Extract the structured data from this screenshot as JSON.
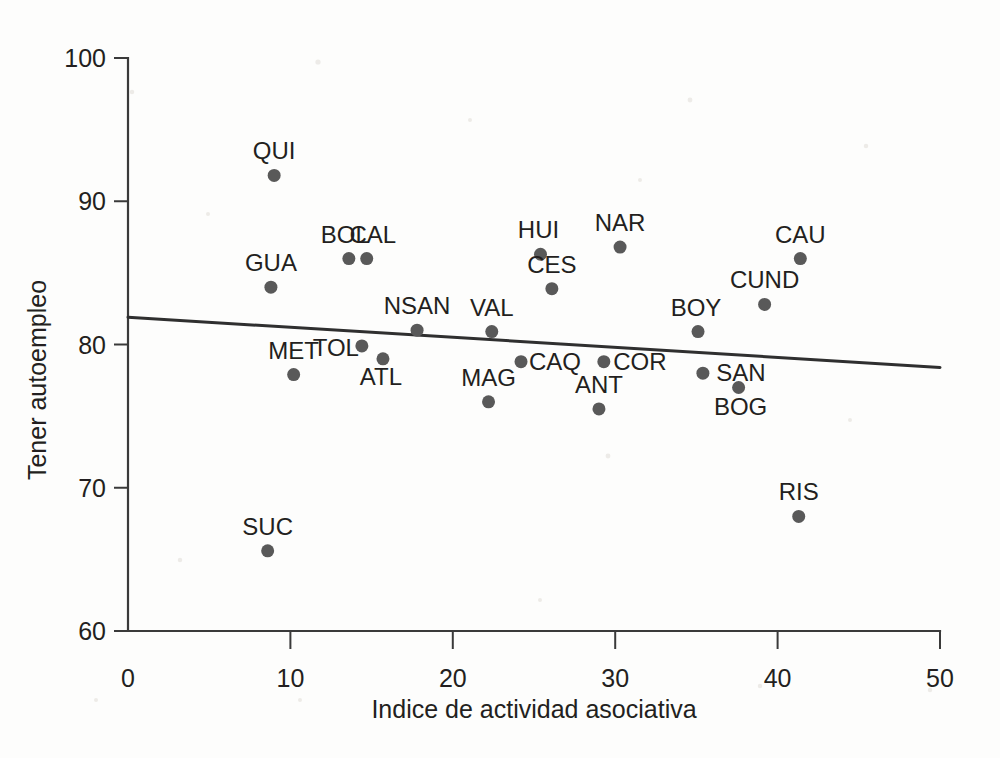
{
  "chart_data": {
    "type": "scatter",
    "title": "",
    "xlabel": "Indice de actividad asociativa",
    "ylabel": "Tener autoempleo",
    "xlim": [
      0,
      50
    ],
    "ylim": [
      60,
      100
    ],
    "xticks": [
      0,
      10,
      20,
      30,
      40,
      50
    ],
    "xtick_labels": [
      "0",
      "10",
      "20",
      "30",
      "40",
      "50"
    ],
    "yticks": [
      60,
      70,
      80,
      90,
      100
    ],
    "ytick_labels": [
      "60",
      "70",
      "80",
      "90",
      "100"
    ],
    "grid": false,
    "legend": "none",
    "point_labels_shown": true,
    "points": [
      {
        "label": "QUI",
        "x": 9.0,
        "y": 91.8,
        "label_dx": 0,
        "label_dy": -16
      },
      {
        "label": "GUA",
        "x": 8.8,
        "y": 84.0,
        "label_dx": 0,
        "label_dy": -16
      },
      {
        "label": "BOL",
        "x": 13.6,
        "y": 86.0,
        "label_dx": -4,
        "label_dy": -16
      },
      {
        "label": "CAL",
        "x": 14.7,
        "y": 86.0,
        "label_dx": 6,
        "label_dy": -16
      },
      {
        "label": "MET",
        "x": 10.2,
        "y": 77.9,
        "label_dx": 0,
        "label_dy": -16
      },
      {
        "label": "TOL",
        "x": 14.4,
        "y": 79.9,
        "label_dx": -26,
        "label_dy": 10
      },
      {
        "label": "ATL",
        "x": 15.7,
        "y": 79.0,
        "label_dx": -2,
        "label_dy": 26
      },
      {
        "label": "NSAN",
        "x": 17.8,
        "y": 81.0,
        "label_dx": 0,
        "label_dy": -16
      },
      {
        "label": "VAL",
        "x": 22.4,
        "y": 80.9,
        "label_dx": 0,
        "label_dy": -16
      },
      {
        "label": "MAG",
        "x": 22.2,
        "y": 76.0,
        "label_dx": 0,
        "label_dy": -16
      },
      {
        "label": "CAQ",
        "x": 24.2,
        "y": 78.8,
        "label_dx": 34,
        "label_dy": 8
      },
      {
        "label": "HUI",
        "x": 25.4,
        "y": 86.3,
        "label_dx": -2,
        "label_dy": -16
      },
      {
        "label": "CES",
        "x": 26.1,
        "y": 83.9,
        "label_dx": 0,
        "label_dy": -16
      },
      {
        "label": "COR",
        "x": 29.3,
        "y": 78.8,
        "label_dx": 36,
        "label_dy": 8
      },
      {
        "label": "ANT",
        "x": 29.0,
        "y": 75.5,
        "label_dx": 0,
        "label_dy": -16
      },
      {
        "label": "NAR",
        "x": 30.3,
        "y": 86.8,
        "label_dx": 0,
        "label_dy": -16
      },
      {
        "label": "BOY",
        "x": 35.1,
        "y": 80.9,
        "label_dx": -2,
        "label_dy": -16
      },
      {
        "label": "SAN",
        "x": 35.4,
        "y": 78.0,
        "label_dx": 38,
        "label_dy": 8
      },
      {
        "label": "BOG",
        "x": 37.6,
        "y": 77.0,
        "label_dx": 2,
        "label_dy": 28
      },
      {
        "label": "CUND",
        "x": 39.2,
        "y": 82.8,
        "label_dx": 0,
        "label_dy": -16
      },
      {
        "label": "CAU",
        "x": 41.4,
        "y": 86.0,
        "label_dx": 0,
        "label_dy": -16
      },
      {
        "label": "RIS",
        "x": 41.3,
        "y": 68.0,
        "label_dx": 0,
        "label_dy": -16
      },
      {
        "label": "SUC",
        "x": 8.6,
        "y": 65.6,
        "label_dx": 0,
        "label_dy": -16
      }
    ],
    "trend_line": {
      "x_start": 0,
      "y_start": 81.9,
      "x_end": 50,
      "y_end": 78.4
    }
  },
  "colors": {
    "point": "#595959",
    "axis": "#3a3a3a",
    "trend": "#2f2f2f",
    "text": "#231f20",
    "background": "#fdfdfc"
  }
}
